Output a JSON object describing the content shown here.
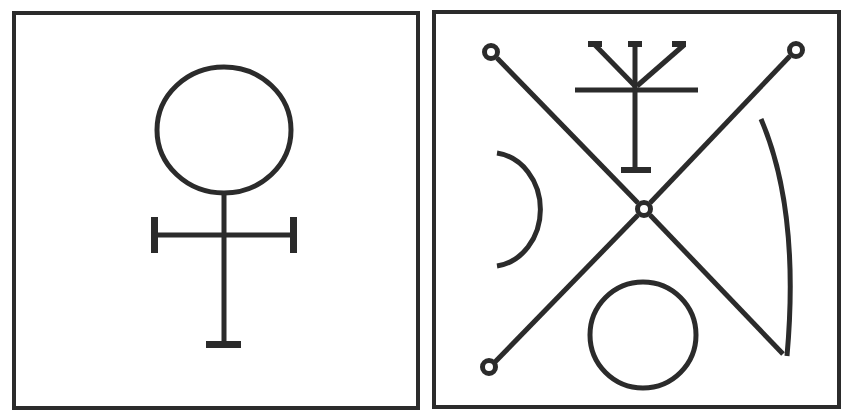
{
  "figure": {
    "description": "Two framed esoteric symbols side by side",
    "panels": [
      {
        "id": "left",
        "label": "Venus / copper alchemical symbol",
        "elements": [
          "circle",
          "vertical-stem",
          "crossbar-with-end-caps",
          "base-bar"
        ]
      },
      {
        "id": "right",
        "label": "Sigil with crossed lines",
        "elements": [
          "diagonal-line-ne-sw",
          "diagonal-line-nw-se",
          "corner-ring-top-left",
          "corner-ring-top-right",
          "corner-ring-bottom-left",
          "center-ring",
          "trident-cross",
          "left-half-circle",
          "right-arc",
          "bottom-circle"
        ]
      }
    ],
    "colors": {
      "ink": "#2b2b2b",
      "background": "#ffffff"
    }
  }
}
